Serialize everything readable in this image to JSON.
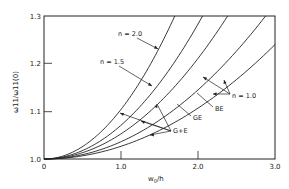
{
  "chart_data": {
    "type": "line",
    "title": "",
    "xlabel": "w0/h",
    "ylabel": "ω11/ω11(0)",
    "xlim": [
      0,
      3.0
    ],
    "ylim": [
      1.0,
      1.3
    ],
    "x_ticks": [
      "0",
      "1.0",
      "2.0",
      "3.0"
    ],
    "y_ticks": [
      "1.0",
      "1.1",
      "1.2",
      "1.3"
    ],
    "grid": false,
    "legend": "none (curves annotated with arrows)",
    "x": [
      0,
      0.25,
      0.5,
      0.75,
      1.0,
      1.25,
      1.5,
      1.75,
      2.0,
      2.25,
      2.5,
      2.75,
      3.0
    ],
    "series": [
      {
        "name": "n = 2.0",
        "values": [
          1.0,
          1.006,
          1.026,
          1.058,
          1.104,
          1.162,
          1.234,
          1.3,
          null,
          null,
          null,
          null,
          null
        ]
      },
      {
        "name": "n = 1.5",
        "values": [
          1.0,
          1.004,
          1.018,
          1.04,
          1.071,
          1.111,
          1.16,
          1.217,
          1.283,
          1.3,
          null,
          null,
          null
        ]
      },
      {
        "name": "GE (n = 1.0)",
        "values": [
          1.0,
          1.003,
          1.013,
          1.029,
          1.053,
          1.082,
          1.119,
          1.161,
          1.211,
          1.267,
          1.3,
          null,
          null
        ]
      },
      {
        "name": "BE (n = 1.0)",
        "values": [
          1.0,
          1.002,
          1.009,
          1.02,
          1.036,
          1.057,
          1.082,
          1.111,
          1.145,
          1.184,
          1.227,
          1.274,
          1.3
        ]
      },
      {
        "name": "G+E (n = 1.0)",
        "values": [
          1.0,
          1.002,
          1.007,
          1.015,
          1.027,
          1.042,
          1.06,
          1.082,
          1.107,
          1.135,
          1.167,
          1.202,
          1.24
        ]
      }
    ],
    "annotations": [
      "n = 2.0",
      "n = 1.5",
      "n = 1.0",
      "GE",
      "BE",
      "G+E"
    ]
  },
  "labels": {
    "x_axis_title": "w",
    "x_axis_title_sub": "0",
    "x_axis_title_tail": "/h",
    "y_axis_title": "ω11/ω11(0)",
    "n20": "n = 2.0",
    "n15": "n = 1.5",
    "n10": "n = 1.0",
    "ge": "GE",
    "be": "BE",
    "gpe": "G+E"
  }
}
